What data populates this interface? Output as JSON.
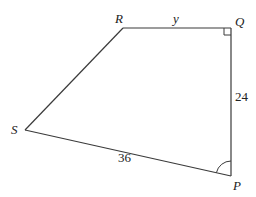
{
  "figure": {
    "type": "quadrilateral",
    "vertices": [
      {
        "name": "S",
        "label": "S"
      },
      {
        "name": "R",
        "label": "R"
      },
      {
        "name": "Q",
        "label": "Q"
      },
      {
        "name": "P",
        "label": "P"
      }
    ],
    "sides": [
      {
        "from": "R",
        "to": "Q",
        "label": "y"
      },
      {
        "from": "Q",
        "to": "P",
        "label": "24"
      },
      {
        "from": "P",
        "to": "S",
        "label": "36"
      },
      {
        "from": "S",
        "to": "R",
        "label": ""
      }
    ],
    "angle_marks": [
      {
        "vertex": "Q",
        "type": "right-angle"
      },
      {
        "vertex": "P",
        "type": "arc"
      }
    ]
  },
  "labels": {
    "S": "S",
    "R": "R",
    "Q": "Q",
    "P": "P",
    "side_RQ": "y",
    "side_QP": "24",
    "side_PS": "36"
  }
}
